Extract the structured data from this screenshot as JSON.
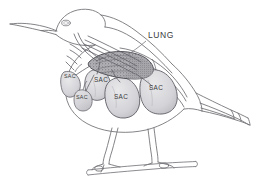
{
  "figure": {
    "style": "pen-and-ink line drawing, grayscale",
    "background_color": "#ffffff",
    "width": 253,
    "height": 177
  },
  "palette": {
    "outline": "#6e6e72",
    "outline_dark": "#4a4a50",
    "label_text": "#3a3a3a",
    "leader_line": "#7a7a80",
    "lung_fill": "#a9a9ad",
    "lung_stipple": "#6a6a70",
    "sac_fill": "#d9d9dc",
    "sac_outline": "#62626a",
    "background": "#ffffff"
  },
  "labels": {
    "lung": {
      "text": "LUNG",
      "x": 148,
      "y": 38
    },
    "sacs": [
      {
        "id": "sac-cervical",
        "text": "SAC",
        "x": 64,
        "y": 78,
        "size": "small"
      },
      {
        "id": "sac-interclavicular",
        "text": "SAC",
        "x": 97,
        "y": 82,
        "size": "normal"
      },
      {
        "id": "sac-anterior-thoracic",
        "text": "SAC",
        "x": 84,
        "y": 98,
        "size": "small"
      },
      {
        "id": "sac-abdominal",
        "text": "SAC",
        "x": 120,
        "y": 98,
        "size": "normal"
      },
      {
        "id": "sac-posterior",
        "text": "SAC",
        "x": 150,
        "y": 90,
        "size": "normal"
      }
    ]
  },
  "anatomy": {
    "organs": [
      {
        "name": "lung",
        "label": "LUNG",
        "type": "stippled-organ"
      },
      {
        "name": "cervical-air-sac",
        "label": "SAC",
        "type": "air-sac"
      },
      {
        "name": "interclavicular-air-sac",
        "label": "SAC",
        "type": "air-sac"
      },
      {
        "name": "anterior-thoracic-air-sac",
        "label": "SAC",
        "type": "air-sac"
      },
      {
        "name": "abdominal-air-sac",
        "label": "SAC",
        "type": "air-sac"
      },
      {
        "name": "posterior-thoracic-air-sac",
        "label": "SAC",
        "type": "air-sac"
      },
      {
        "name": "trachea",
        "label": "",
        "type": "tube"
      },
      {
        "name": "bronchi",
        "label": "",
        "type": "tube-network"
      }
    ],
    "body_parts": [
      "beak",
      "head",
      "eye",
      "neck",
      "torso",
      "wing",
      "tail",
      "left-leg",
      "right-leg",
      "perch"
    ]
  }
}
